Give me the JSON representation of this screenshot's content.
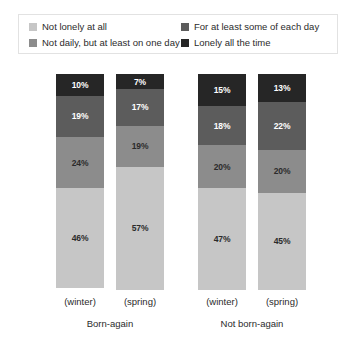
{
  "chart_data": {
    "type": "bar",
    "subtype": "stacked-percentage",
    "title": "",
    "xlabel": "",
    "ylabel": "",
    "ylim": [
      0,
      100
    ],
    "grid": false,
    "legend_position": "top",
    "categories": [
      "(winter)",
      "(spring)",
      "(winter)",
      "(spring)"
    ],
    "groups": [
      {
        "name": "Born-again",
        "bars": [
          {
            "category": "(winter)",
            "segments": [
              {
                "label": "Not lonely at all",
                "value": 46,
                "text": "46%"
              },
              {
                "label": "Not daily, but at least on one day",
                "value": 24,
                "text": "24%"
              },
              {
                "label": "For at least some of each day",
                "value": 19,
                "text": "19%"
              },
              {
                "label": "Lonely all the time",
                "value": 10,
                "text": "10%"
              }
            ]
          },
          {
            "category": "(spring)",
            "segments": [
              {
                "label": "Not lonely at all",
                "value": 57,
                "text": "57%"
              },
              {
                "label": "Not daily, but at least on one day",
                "value": 19,
                "text": "19%"
              },
              {
                "label": "For at least some of each day",
                "value": 17,
                "text": "17%"
              },
              {
                "label": "Lonely all the time",
                "value": 7,
                "text": "7%"
              }
            ]
          }
        ]
      },
      {
        "name": "Not born-again",
        "bars": [
          {
            "category": "(winter)",
            "segments": [
              {
                "label": "Not lonely at all",
                "value": 47,
                "text": "47%"
              },
              {
                "label": "Not daily, but at least on one day",
                "value": 20,
                "text": "20%"
              },
              {
                "label": "For at least some of each day",
                "value": 18,
                "text": "18%"
              },
              {
                "label": "Lonely all the time",
                "value": 15,
                "text": "15%"
              }
            ]
          },
          {
            "category": "(spring)",
            "segments": [
              {
                "label": "Not lonely at all",
                "value": 45,
                "text": "45%"
              },
              {
                "label": "Not daily, but at least on one day",
                "value": 20,
                "text": "20%"
              },
              {
                "label": "For at least some of each day",
                "value": 22,
                "text": "22%"
              },
              {
                "label": "Lonely all the time",
                "value": 13,
                "text": "13%"
              }
            ]
          }
        ]
      }
    ],
    "series": [
      {
        "name": "Not lonely at all",
        "color": "#c6c6c6",
        "values": [
          46,
          57,
          47,
          45
        ]
      },
      {
        "name": "Not daily, but at least on one day",
        "color": "#8c8c8c",
        "values": [
          24,
          19,
          20,
          20
        ]
      },
      {
        "name": "For at least some of each day",
        "color": "#5c5c5c",
        "values": [
          19,
          17,
          18,
          22
        ]
      },
      {
        "name": "Lonely all the time",
        "color": "#262626",
        "values": [
          10,
          7,
          15,
          13
        ]
      }
    ]
  },
  "legend": {
    "items": [
      {
        "label": "Not lonely at all",
        "color": "#c6c6c6"
      },
      {
        "label": "For at least some of each day",
        "color": "#5c5c5c"
      },
      {
        "label": "Not daily, but at least on one day",
        "color": "#8c8c8c"
      },
      {
        "label": "Lonely all the time",
        "color": "#262626"
      }
    ]
  },
  "axis": {
    "groups": [
      {
        "name": "Born-again",
        "seasons": [
          "(winter)",
          "(spring)"
        ]
      },
      {
        "name": "Not born-again",
        "seasons": [
          "(winter)",
          "(spring)"
        ]
      }
    ]
  },
  "colors": {
    "not_lonely_at_all": "#c6c6c6",
    "not_daily_but_at_least_one_day": "#8c8c8c",
    "at_least_some_of_each_day": "#5c5c5c",
    "lonely_all_the_time": "#262626",
    "legend_border": "#e2e2e2",
    "text": "#2b2b2b"
  }
}
